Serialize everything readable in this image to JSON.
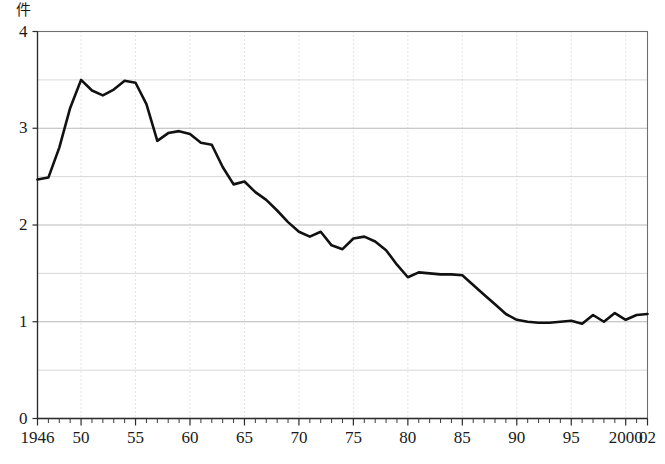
{
  "chart_data": {
    "type": "line",
    "title": "",
    "subtitle": "",
    "xlabel": "",
    "ylabel": "件",
    "ylabel_note": "y-axis unit caption rendered above axis",
    "xlim": [
      1946,
      2002
    ],
    "ylim": [
      0,
      4
    ],
    "y_ticks": [
      0,
      1,
      2,
      3,
      4
    ],
    "y_tick_labels": [
      "0",
      "1",
      "2",
      "3",
      "4"
    ],
    "y_minor_ticks": [
      0.5,
      1.5,
      2.5,
      3.5
    ],
    "x_ticks": [
      1946,
      1950,
      1955,
      1960,
      1965,
      1970,
      1975,
      1980,
      1985,
      1990,
      1995,
      2000,
      2002
    ],
    "x_tick_labels": [
      "1946",
      "50",
      "55",
      "60",
      "65",
      "70",
      "75",
      "80",
      "85",
      "90",
      "95",
      "2000",
      "02"
    ],
    "x_minor_tick_interval": 1,
    "grid": "horizontal-solid-and-vertical-dotted-at-5yr",
    "legend": "none",
    "annotations": [],
    "series": [
      {
        "name": "",
        "color": "#111111",
        "x": [
          1946,
          1947,
          1948,
          1949,
          1950,
          1951,
          1952,
          1953,
          1954,
          1955,
          1956,
          1957,
          1958,
          1959,
          1960,
          1961,
          1962,
          1963,
          1964,
          1965,
          1966,
          1967,
          1968,
          1969,
          1970,
          1971,
          1972,
          1973,
          1974,
          1975,
          1976,
          1977,
          1978,
          1979,
          1980,
          1981,
          1982,
          1983,
          1984,
          1985,
          1986,
          1987,
          1988,
          1989,
          1990,
          1991,
          1992,
          1993,
          1994,
          1995,
          1996,
          1997,
          1998,
          1999,
          2000,
          2001,
          2002
        ],
        "values": [
          2.47,
          2.49,
          2.8,
          3.21,
          3.5,
          3.39,
          3.34,
          3.4,
          3.49,
          3.47,
          3.25,
          2.87,
          2.95,
          2.97,
          2.94,
          2.85,
          2.83,
          2.6,
          2.42,
          2.45,
          2.34,
          2.26,
          2.15,
          2.03,
          1.93,
          1.88,
          1.93,
          1.79,
          1.75,
          1.86,
          1.88,
          1.83,
          1.74,
          1.59,
          1.46,
          1.51,
          1.5,
          1.49,
          1.49,
          1.48,
          1.38,
          1.28,
          1.18,
          1.08,
          1.02,
          1.0,
          0.99,
          0.99,
          1.0,
          1.01,
          0.98,
          1.07,
          1.0,
          1.09,
          1.02,
          1.07,
          1.08
        ]
      }
    ]
  }
}
